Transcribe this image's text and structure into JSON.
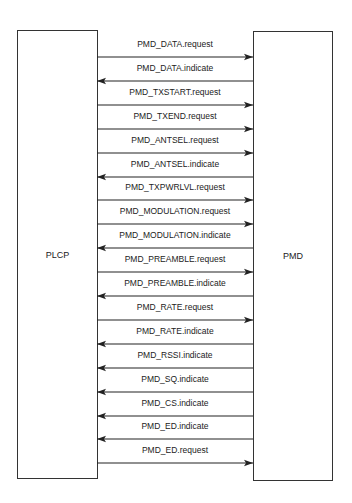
{
  "diagram": {
    "left_entity": {
      "label": "PLCP"
    },
    "right_entity": {
      "label": "PMD"
    },
    "messages": [
      {
        "label": "PMD_DATA.request",
        "direction": "right"
      },
      {
        "label": "PMD_DATA.indicate",
        "direction": "left"
      },
      {
        "label": "PMD_TXSTART.request",
        "direction": "right"
      },
      {
        "label": "PMD_TXEND.request",
        "direction": "right"
      },
      {
        "label": "PMD_ANTSEL.request",
        "direction": "right"
      },
      {
        "label": "PMD_ANTSEL.indicate",
        "direction": "left"
      },
      {
        "label": "PMD_TXPWRLVL.request",
        "direction": "right"
      },
      {
        "label": "PMD_MODULATION.request",
        "direction": "right"
      },
      {
        "label": "PMD_MODULATION.indicate",
        "direction": "left"
      },
      {
        "label": "PMD_PREAMBLE.request",
        "direction": "right"
      },
      {
        "label": "PMD_PREAMBLE.indicate",
        "direction": "left"
      },
      {
        "label": "PMD_RATE.request",
        "direction": "right"
      },
      {
        "label": "PMD_RATE.indicate",
        "direction": "left"
      },
      {
        "label": "PMD_RSSI.indicate",
        "direction": "left"
      },
      {
        "label": "PMD_SQ.indicate",
        "direction": "left"
      },
      {
        "label": "PMD_CS.indicate",
        "direction": "left"
      },
      {
        "label": "PMD_ED.indicate",
        "direction": "left"
      },
      {
        "label": "PMD_ED.request",
        "direction": "right"
      }
    ]
  }
}
